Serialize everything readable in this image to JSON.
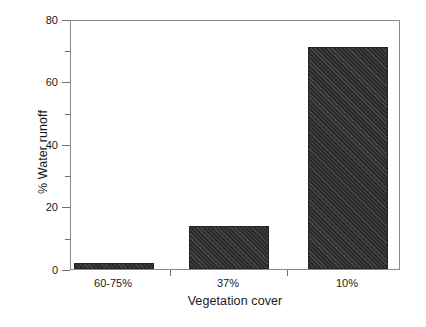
{
  "chart_data": {
    "type": "bar",
    "title": "",
    "xlabel": "Vegetation cover",
    "ylabel": "% Water runoff",
    "categories": [
      "60-75%",
      "37%",
      "10%"
    ],
    "values": [
      2,
      14,
      71.5
    ],
    "ylim": [
      0,
      80
    ],
    "yticks": [
      0,
      20,
      40,
      60,
      80
    ],
    "ytick_labels": [
      "0",
      "20",
      "40",
      "60",
      "80"
    ],
    "yminor_ticks": [
      10,
      30,
      50,
      70
    ],
    "grid": false,
    "legend": null,
    "bar_color": "#2b2b2b",
    "bar_fill": "diagonal-hatch",
    "axis_color": "#8a8a8a",
    "background": "#ffffff"
  },
  "axes": {
    "y": {
      "label": "% Water runoff",
      "ticks": [
        {
          "value": 80,
          "label": "80"
        },
        {
          "value": 60,
          "label": "60"
        },
        {
          "value": 40,
          "label": "40"
        },
        {
          "value": 20,
          "label": "20"
        },
        {
          "value": 0,
          "label": "0"
        }
      ]
    },
    "x": {
      "label": "Vegetation cover",
      "ticks": [
        {
          "label": "60-75%"
        },
        {
          "label": "37%"
        },
        {
          "label": "10%"
        }
      ]
    }
  },
  "bars": [
    {
      "category": "60-75%",
      "value": 2
    },
    {
      "category": "37%",
      "value": 14
    },
    {
      "category": "10%",
      "value": 71.5
    }
  ]
}
